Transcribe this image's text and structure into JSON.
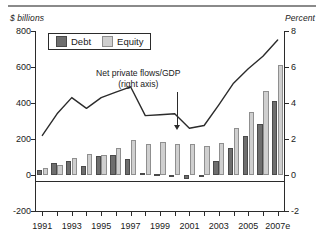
{
  "chart_data": {
    "type": "bar",
    "title": "",
    "subtitle": "",
    "unit_left": "$ billions",
    "unit_right": "Percent",
    "xlabel": "",
    "ylabel": "$ billions",
    "ylabel_right": "Percent",
    "ylim": [
      -200,
      800
    ],
    "ylim_right": [
      -2,
      8
    ],
    "yticks": [
      800,
      600,
      400,
      200,
      0,
      -200
    ],
    "ytick_labels": [
      "800",
      "600",
      "400",
      "200",
      "0",
      "-200"
    ],
    "yticks_right": [
      8,
      6,
      4,
      2,
      0,
      -2
    ],
    "ytick_labels_right": [
      "8",
      "6",
      "4",
      "2",
      "0",
      "-2"
    ],
    "grid": false,
    "legend_position": "upper-left",
    "categories": [
      "1991",
      "1992",
      "1993",
      "1994",
      "1995",
      "1996",
      "1997",
      "1998",
      "1999",
      "2000",
      "2001",
      "2002",
      "2003",
      "2004",
      "2005",
      "2006",
      "2007e"
    ],
    "xtick_labels": [
      "1991",
      "",
      "1993",
      "",
      "1995",
      "",
      "1997",
      "",
      "1999",
      "",
      "2001",
      "",
      "2003",
      "",
      "2005",
      "",
      "2007e"
    ],
    "series": [
      {
        "name": "Debt",
        "color": "#6e6e6e",
        "axis": "left",
        "values": [
          30,
          68,
          77,
          50,
          105,
          110,
          88,
          13,
          3,
          0,
          -22,
          2,
          80,
          150,
          218,
          285,
          410
        ]
      },
      {
        "name": "Equity",
        "color": "#cfcfcf",
        "axis": "left",
        "values": [
          38,
          58,
          96,
          115,
          113,
          152,
          196,
          172,
          185,
          175,
          175,
          163,
          180,
          260,
          352,
          467,
          610
        ]
      },
      {
        "name": "Net private flows/GDP",
        "color": "#2b2b2b",
        "axis": "right",
        "type": "line",
        "values": [
          2.2,
          3.4,
          4.3,
          3.7,
          4.3,
          4.6,
          4.9,
          3.3,
          3.35,
          3.4,
          2.6,
          2.75,
          3.9,
          5.1,
          5.9,
          6.6,
          7.5
        ]
      }
    ],
    "annotations": [
      {
        "name": "line-callout",
        "line1": "Net private flows/GDP",
        "line2": "(right axis)",
        "points_to_year": "2000"
      }
    ],
    "legend": [
      {
        "label": "Debt",
        "color": "#6e6e6e"
      },
      {
        "label": "Equity",
        "color": "#cfcfcf"
      }
    ]
  }
}
